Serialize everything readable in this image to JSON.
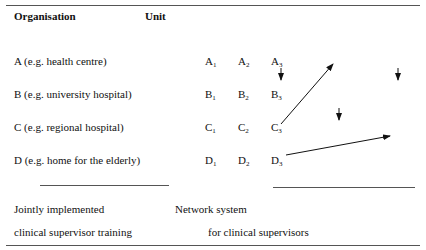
{
  "header": {
    "organisation": "Organisation",
    "unit": "Unit"
  },
  "rows": [
    {
      "label": "A (e.g. health centre)",
      "letter": "A"
    },
    {
      "label": "B (e.g. university hospital)",
      "letter": "B"
    },
    {
      "label": "C (e.g. regional hospital)",
      "letter": "C"
    },
    {
      "label": "D (e.g. home for the elderly)",
      "letter": "D"
    }
  ],
  "unit_indices": [
    "1",
    "2",
    "3"
  ],
  "footer": {
    "left_line1": "Jointly implemented",
    "left_line2": "clinical supervisor training",
    "right_line1": "Network system",
    "right_line2": "for clinical supervisors"
  }
}
